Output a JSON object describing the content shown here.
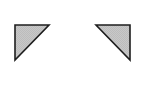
{
  "shapes": [
    {
      "name": "left-corner-triangle",
      "points": "15,25 49,25 15,60",
      "fill": "#c4c4c4",
      "stroke": "#1e1e1e"
    },
    {
      "name": "right-corner-triangle",
      "points": "96,25 130,25 130,60",
      "fill": "#c4c4c4",
      "stroke": "#1e1e1e"
    }
  ],
  "colors": {
    "background": "#ffffff",
    "fill": "#c4c4c4",
    "stroke": "#1e1e1e"
  }
}
